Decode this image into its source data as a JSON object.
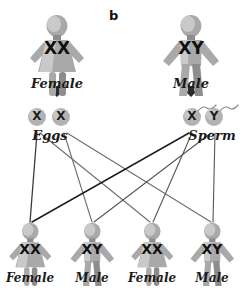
{
  "panel": {
    "label": "b"
  },
  "parents": [
    {
      "name": "female-parent",
      "sex": "female",
      "genotype": "XX",
      "label": "Female",
      "x": 57,
      "y": 14,
      "scale": 1.0,
      "geno_x": 57,
      "geno_y": 38,
      "label_x": 57,
      "label_y": 76,
      "arrow_x": 57,
      "arrow_y": 86
    },
    {
      "name": "male-parent",
      "sex": "male",
      "genotype": "XY",
      "label": "Male",
      "x": 191,
      "y": 14,
      "scale": 1.0,
      "geno_x": 191,
      "geno_y": 38,
      "label_x": 191,
      "label_y": 76,
      "arrow_x": 191,
      "arrow_y": 86
    }
  ],
  "gametes": {
    "eggs": {
      "label": "Eggs",
      "label_x": 50,
      "label_y": 128,
      "cells": [
        {
          "name": "egg-x-1",
          "allele": "X",
          "cx": 37,
          "cy": 117,
          "r": 9,
          "tail": false
        },
        {
          "name": "egg-x-2",
          "allele": "X",
          "cx": 61,
          "cy": 117,
          "r": 9,
          "tail": false
        }
      ]
    },
    "sperm": {
      "label": "Sperm",
      "label_x": 212,
      "label_y": 128,
      "cells": [
        {
          "name": "sperm-x",
          "allele": "X",
          "cx": 192,
          "cy": 117,
          "r": 9,
          "tail": true
        },
        {
          "name": "sperm-y",
          "allele": "Y",
          "cx": 214,
          "cy": 117,
          "r": 9,
          "tail": true
        }
      ]
    }
  },
  "offspring": [
    {
      "name": "offspring-female-1",
      "sex": "female",
      "genotype": "XX",
      "label": "Female",
      "x": 30,
      "y": 222,
      "scale": 0.78,
      "geno_x": 30,
      "geno_y": 241,
      "label_x": 30,
      "label_y": 271
    },
    {
      "name": "offspring-male-1",
      "sex": "male",
      "genotype": "XY",
      "label": "Male",
      "x": 92,
      "y": 222,
      "scale": 0.78,
      "geno_x": 92,
      "geno_y": 241,
      "label_x": 92,
      "label_y": 271
    },
    {
      "name": "offspring-female-2",
      "sex": "female",
      "genotype": "XX",
      "label": "Female",
      "x": 152,
      "y": 222,
      "scale": 0.78,
      "geno_x": 152,
      "geno_y": 241,
      "label_x": 152,
      "label_y": 271
    },
    {
      "name": "offspring-male-2",
      "sex": "male",
      "genotype": "XY",
      "label": "Male",
      "x": 212,
      "y": 222,
      "scale": 0.78,
      "geno_x": 212,
      "geno_y": 241,
      "label_x": 212,
      "label_y": 271
    }
  ],
  "cross_lines": [
    {
      "name": "line-egg1-to-offspring1",
      "x1": 37,
      "y1": 133,
      "x2": 30,
      "y2": 222,
      "color": "#3a3a3a",
      "width": 1.3
    },
    {
      "name": "line-egg1-to-offspring3",
      "x1": 40,
      "y1": 133,
      "x2": 150,
      "y2": 222,
      "color": "#6e6e6e",
      "width": 1.1
    },
    {
      "name": "line-egg2-to-offspring2",
      "x1": 64,
      "y1": 133,
      "x2": 92,
      "y2": 222,
      "color": "#6e6e6e",
      "width": 1.1
    },
    {
      "name": "line-egg2-to-offspring4",
      "x1": 67,
      "y1": 133,
      "x2": 211,
      "y2": 222,
      "color": "#6e6e6e",
      "width": 1.1
    },
    {
      "name": "line-sperm-x-to-offspring1",
      "x1": 189,
      "y1": 133,
      "x2": 32,
      "y2": 222,
      "color": "#1f1f1f",
      "width": 1.5
    },
    {
      "name": "line-sperm-x-to-offspring3",
      "x1": 192,
      "y1": 133,
      "x2": 153,
      "y2": 222,
      "color": "#555555",
      "width": 1.1
    },
    {
      "name": "line-sperm-y-to-offspring2",
      "x1": 211,
      "y1": 133,
      "x2": 94,
      "y2": 222,
      "color": "#555555",
      "width": 1.1
    },
    {
      "name": "line-sperm-y-to-offspring4",
      "x1": 215,
      "y1": 133,
      "x2": 213,
      "y2": 222,
      "color": "#555555",
      "width": 1.1
    }
  ],
  "colors": {
    "body": "#a9a9a9",
    "body_light": "#c9c9c9",
    "body_dark": "#8d8d8d",
    "gamete": "#b2b2b2",
    "text": "#1a1a1a",
    "background": "#ffffff"
  }
}
